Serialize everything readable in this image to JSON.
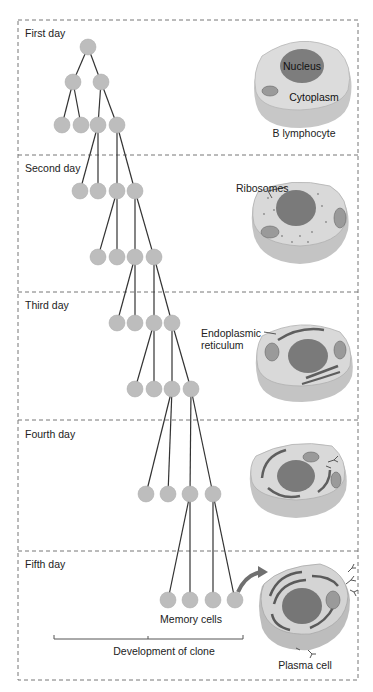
{
  "diagram": {
    "colors": {
      "node_fill": "#bdbdbd",
      "line": "#333333",
      "divider": "#777777",
      "cell_body": "#d6d6d6",
      "cell_edge": "#a8a8a8",
      "nucleus": "#7a7a7a",
      "er": "#6b6b6b",
      "arrow": "#707070"
    },
    "days": [
      {
        "label": "First day"
      },
      {
        "label": "Second day"
      },
      {
        "label": "Third day"
      },
      {
        "label": "Fourth day"
      },
      {
        "label": "Fifth day"
      }
    ],
    "cells": {
      "day1": {
        "caption": "B lymphocyte",
        "nucleus_label": "Nucleus",
        "cytoplasm_label": "Cytoplasm"
      },
      "day2": {
        "callout": "Ribosomes"
      },
      "day3": {
        "callout_line1": "Endoplasmic",
        "callout_line2": "reticulum"
      },
      "day4": {},
      "day5": {
        "caption": "Plasma cell"
      }
    },
    "memory_cells_label": "Memory cells",
    "clone_bracket_label": "Development of clone"
  }
}
